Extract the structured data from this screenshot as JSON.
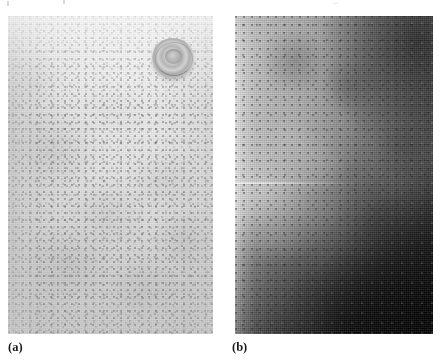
{
  "figure": {
    "kind": "two-panel clinical photograph figure",
    "background_color": "#ffffff",
    "panels": [
      {
        "id": "a",
        "caption": "(a)",
        "description": "Light grayscale clinical photograph of skin on the chest/torso showing a fine, dense maculopapular rash of small darker macules over pale skin; a nipple and areola are visible in the upper right of the frame.",
        "tone": "light",
        "features": [
          "nipple-areola",
          "maculopapular-rash-speckle",
          "darker-left-edge-shading",
          "darker-lower-region"
        ],
        "rect": {
          "x": 8,
          "y": 16,
          "width": 205,
          "height": 318
        }
      },
      {
        "id": "b",
        "caption": "(b)",
        "description": "Darker grayscale close-up of skin showing a mottled rash; a bright diagonal highlight band runs from the upper left down the left side, with deeply shadowed regions in the upper right and the lower right corner following the curve of the body.",
        "tone": "dark",
        "features": [
          "bright-diagonal-highlight-band",
          "dark-upper-right-shadow",
          "very-dark-lower-right-corner",
          "mottled-rash-speckle",
          "horizontal-light-streak"
        ],
        "rect": {
          "x": 235,
          "y": 16,
          "width": 198,
          "height": 318
        }
      }
    ],
    "artifacts": {
      "description": "faint scanner specks along the top page margin",
      "count": 3
    }
  },
  "colors": {
    "page_background": "#ffffff",
    "panel_a_light": "#ededed",
    "panel_a_mid": "#d8d8d8",
    "panel_a_dark_edge": "#9a9a9a",
    "panel_b_light": "#d9d9d9",
    "panel_b_mid": "#6d6d6d",
    "panel_b_dark": "#0d0d0d",
    "caption_text": "#1b1b1b"
  }
}
